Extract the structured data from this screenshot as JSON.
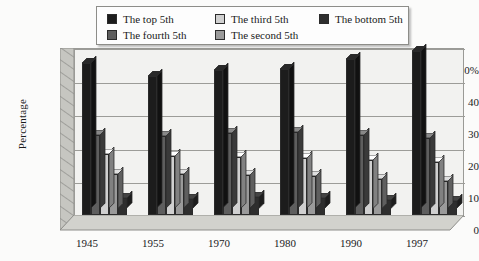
{
  "chart_data": {
    "type": "bar",
    "title": "",
    "xlabel": "",
    "ylabel": "Percentage",
    "ylim": [
      0,
      50
    ],
    "yticks": [
      "0",
      "10",
      "20",
      "30",
      "40",
      "50%"
    ],
    "grid": true,
    "legend_position": "top-center",
    "style": "3d-grouped-column",
    "categories": [
      "1945",
      "1955",
      "1970",
      "1980",
      "1990",
      "1997"
    ],
    "series": [
      {
        "name": "The top 5th",
        "color": "#1c1c1c",
        "values": [
          45.5,
          41.5,
          43.3,
          43.7,
          46.6,
          49.0
        ]
      },
      {
        "name": "The fourth 5th",
        "color": "#5e5e5e",
        "values": [
          24.0,
          23.7,
          24.5,
          24.8,
          24.0,
          23.2
        ]
      },
      {
        "name": "The third 5th",
        "color": "#d0d0d0",
        "values": [
          18.3,
          17.6,
          17.4,
          17.0,
          16.6,
          15.8
        ]
      },
      {
        "name": "The second 5th",
        "color": "#9a9a9a",
        "values": [
          12.4,
          12.2,
          12.0,
          11.7,
          10.9,
          10.2
        ]
      },
      {
        "name": "The bottom 5th",
        "color": "#2e2e2e",
        "values": [
          5.0,
          4.8,
          5.5,
          5.1,
          4.6,
          4.2
        ]
      }
    ]
  },
  "legend": {
    "entries": [
      {
        "label": "The top 5th",
        "swatch": "#1c1c1c"
      },
      {
        "label": "The third 5th",
        "swatch": "#d0d0d0"
      },
      {
        "label": "The bottom 5th",
        "swatch": "#2e2e2e"
      },
      {
        "label": "The fourth 5th",
        "swatch": "#5e5e5e"
      },
      {
        "label": "The second 5th",
        "swatch": "#9a9a9a"
      }
    ]
  },
  "axis": {
    "y_title": "Percentage",
    "y_ticks": [
      "50%",
      "40",
      "30",
      "20",
      "10",
      "0"
    ],
    "x_ticks": [
      "1945",
      "1955",
      "1970",
      "1980",
      "1990",
      "1997"
    ]
  },
  "colors": {
    "background": "#fbfbfa",
    "plot_wall": "#f2f2f0",
    "gridline": "#9c9c98",
    "floor": "#cdcdc8",
    "left_wall": "#bfbfba"
  }
}
